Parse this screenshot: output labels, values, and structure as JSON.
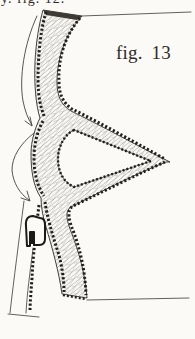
{
  "figure": {
    "label": "fig. 13",
    "cropped_caption_above": "y. fig. 12."
  },
  "colors": {
    "paper": "#fbfaf7",
    "ink": "#2e2c28",
    "hatch": "#8f8d88",
    "stitch_beads": "#22201d"
  },
  "elements": {
    "drawing": "scalloped-band-cross-section",
    "arrows": 2,
    "hook": "clasp-cross-section"
  }
}
